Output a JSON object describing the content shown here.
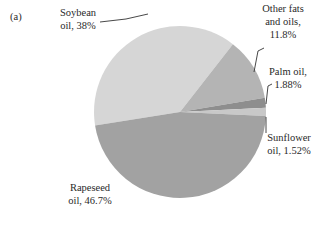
{
  "chart_data": {
    "type": "pie",
    "title": "",
    "panel_label": "(a)",
    "unit": "%",
    "slices": [
      {
        "name": "Soybean oil",
        "value": 38.0,
        "label_lines": [
          "Soybean",
          "oil, 38%"
        ],
        "color": "#d6d6d6"
      },
      {
        "name": "Other fats and oils",
        "value": 11.8,
        "label_lines": [
          "Other fats",
          "and oils,",
          "11.8%"
        ],
        "color": "#b4b4b4"
      },
      {
        "name": "Palm oil",
        "value": 1.88,
        "label_lines": [
          "Palm oil,",
          "1.88%"
        ],
        "color": "#8e8e8e"
      },
      {
        "name": "Sunflower oil",
        "value": 1.52,
        "label_lines": [
          "Sunflower",
          "oil, 1.52%"
        ],
        "color": "#c8c8c8"
      },
      {
        "name": "Rapeseed oil",
        "value": 46.7,
        "label_lines": [
          "Rapeseed",
          "oil, 46.7%"
        ],
        "color": "#a2a2a2"
      }
    ],
    "legend": "none",
    "labels": "outside-with-leaders"
  }
}
